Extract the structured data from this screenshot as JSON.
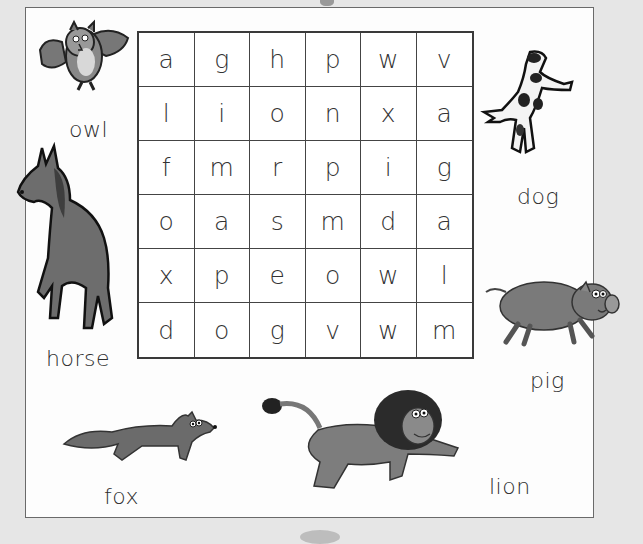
{
  "puzzle": {
    "type": "word-search",
    "grid": [
      [
        "a",
        "g",
        "h",
        "p",
        "w",
        "v"
      ],
      [
        "l",
        "i",
        "o",
        "n",
        "x",
        "a"
      ],
      [
        "f",
        "m",
        "r",
        "p",
        "i",
        "g"
      ],
      [
        "o",
        "a",
        "s",
        "m",
        "d",
        "a"
      ],
      [
        "x",
        "p",
        "e",
        "o",
        "w",
        "l"
      ],
      [
        "d",
        "o",
        "g",
        "v",
        "w",
        "m"
      ]
    ]
  },
  "animals": {
    "owl": {
      "label": "owl",
      "icon": "owl-icon"
    },
    "horse": {
      "label": "horse",
      "icon": "horse-icon"
    },
    "dog": {
      "label": "dog",
      "icon": "dog-icon"
    },
    "pig": {
      "label": "pig",
      "icon": "pig-icon"
    },
    "fox": {
      "label": "fox",
      "icon": "fox-icon"
    },
    "lion": {
      "label": "lion",
      "icon": "lion-icon"
    }
  },
  "colors": {
    "background": "#e6e6e6",
    "paper": "#fdfdfd",
    "grid_line": "#444444",
    "text": "#333333"
  }
}
